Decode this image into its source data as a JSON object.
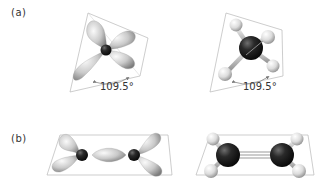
{
  "figure": {
    "panels": [
      {
        "id": "a",
        "label": "(a)",
        "description": "sp3 hybridization - tetrahedral geometry",
        "left": {
          "type": "orbital-model",
          "lobes": 4,
          "angle_label": "109.5°"
        },
        "right": {
          "type": "ball-and-stick",
          "molecule": "methane",
          "central_atom": "C",
          "substituents": [
            "H",
            "H",
            "H",
            "H"
          ],
          "angle_label": "109.5°"
        }
      },
      {
        "id": "b",
        "label": "(b)",
        "description": "sp2 hybridization - planar geometry",
        "left": {
          "type": "orbital-model",
          "atoms": 2,
          "lobes": 5
        },
        "right": {
          "type": "ball-and-stick",
          "molecule": "ethylene",
          "atoms": [
            "C",
            "C"
          ],
          "substituents": [
            "H",
            "H",
            "H",
            "H"
          ],
          "bond": "double"
        }
      }
    ]
  },
  "colors": {
    "frame": "#b8b8b8",
    "lobe_light": "#f2f2f2",
    "lobe_dark": "#8a8a8a",
    "carbon": "#1a1a1a",
    "hydrogen": "#e6e6e6",
    "text": "#333333",
    "arrow": "#777777"
  }
}
